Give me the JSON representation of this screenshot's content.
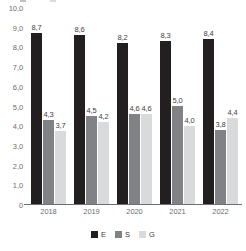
{
  "chart_data": {
    "type": "bar",
    "title": "",
    "subtitle": "",
    "xlabel": "",
    "ylabel": "",
    "categories": [
      "2018",
      "2019",
      "2020",
      "2021",
      "2022"
    ],
    "series": [
      {
        "name": "E",
        "color": "#231f20",
        "values": [
          8.7,
          8.6,
          8.2,
          8.3,
          8.4
        ],
        "labels": [
          "8,7",
          "8,6",
          "8,2",
          "8,3",
          "8,4"
        ]
      },
      {
        "name": "S",
        "color": "#808285",
        "values": [
          4.3,
          4.5,
          4.6,
          5.0,
          3.8
        ],
        "labels": [
          "4,3",
          "4,5",
          "4,6",
          "5,0",
          "3,8"
        ]
      },
      {
        "name": "G",
        "color": "#d9dadb",
        "values": [
          3.7,
          4.2,
          4.6,
          4.0,
          4.4
        ],
        "labels": [
          "3,7",
          "4,2",
          "4,6",
          "4,0",
          "4,4"
        ]
      }
    ],
    "ylim": [
      0,
      10
    ],
    "y_ticks": [
      "10,0",
      "9,0",
      "8,0",
      "7,0",
      "6,0",
      "5,0",
      "4,0",
      "3,0",
      "2,0",
      "1,0",
      "0"
    ],
    "y_tick_values": [
      10,
      9,
      8,
      7,
      6,
      5,
      4,
      3,
      2,
      1,
      0
    ],
    "grid": false,
    "legend_position": "bottom",
    "legend": [
      {
        "label": "E",
        "color": "#231f20"
      },
      {
        "label": "S",
        "color": "#808285"
      },
      {
        "label": "G",
        "color": "#d9dadb"
      }
    ]
  },
  "colors": {
    "series_e": "#231f20",
    "series_s": "#808285",
    "series_g": "#d9dadb",
    "axis_text": "#6d6e71",
    "label_text": "#414042",
    "background": "#ffffff"
  }
}
